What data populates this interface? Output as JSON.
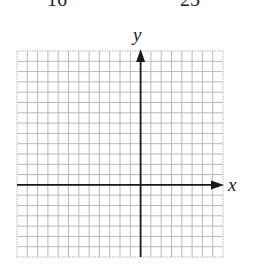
{
  "header": {
    "cutoff_left": "16",
    "cutoff_right": "25"
  },
  "graph": {
    "x_label": "x",
    "y_label": "y",
    "grid": {
      "columns": 20,
      "rows": 20,
      "left": 17,
      "top": 51,
      "cell": 10.3,
      "y_axis_column": 12,
      "x_axis_row": 13
    },
    "colors": {
      "grid": "#b8b8b8",
      "axis": "#1a1a1a",
      "text": "#222222"
    }
  }
}
